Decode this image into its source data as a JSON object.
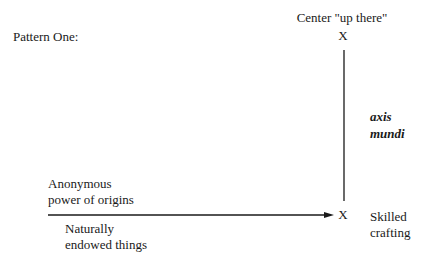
{
  "title": "Pattern One:",
  "top_node": {
    "label": "Center \"up there\"",
    "marker": "X"
  },
  "vertical_axis": {
    "label_lines": [
      "axis",
      "mundi"
    ]
  },
  "bottom_node": {
    "marker": "X",
    "label_lines": [
      "Skilled",
      "crafting"
    ]
  },
  "horizontal_arrow": {
    "above_lines": [
      "Anonymous",
      "power of origins"
    ],
    "below_lines": [
      "Naturally",
      "endowed things"
    ]
  },
  "colors": {
    "ink": "#1a1a1a",
    "background": "#ffffff"
  }
}
